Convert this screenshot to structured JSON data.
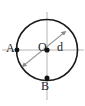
{
  "figure": {
    "type": "geometry-diagram",
    "background_color": "#ffffff",
    "stroke_color": "#1a1a1a",
    "arrow_color": "#999999",
    "axis_color": "#b0b0b0",
    "labels": {
      "point_a": "A",
      "centre_o": "O",
      "diameter_d": "d",
      "point_b": "B"
    },
    "geometry": {
      "circle": {
        "cx": 47,
        "cy": 50,
        "r": 30.5
      },
      "points": [
        {
          "name": "A",
          "x": 17,
          "y": 50
        },
        {
          "name": "O",
          "x": 47,
          "y": 50
        },
        {
          "name": "B",
          "x": 47,
          "y": 78
        }
      ],
      "horizontal_axis": {
        "x1": 2,
        "y1": 50,
        "x2": 84,
        "y2": 50
      },
      "vertical_axis": {
        "x1": 47,
        "y1": 12,
        "x2": 47,
        "y2": 100
      },
      "diameter_arrow": {
        "x1": 22,
        "y1": 67,
        "x2": 66,
        "y2": 31
      }
    }
  }
}
